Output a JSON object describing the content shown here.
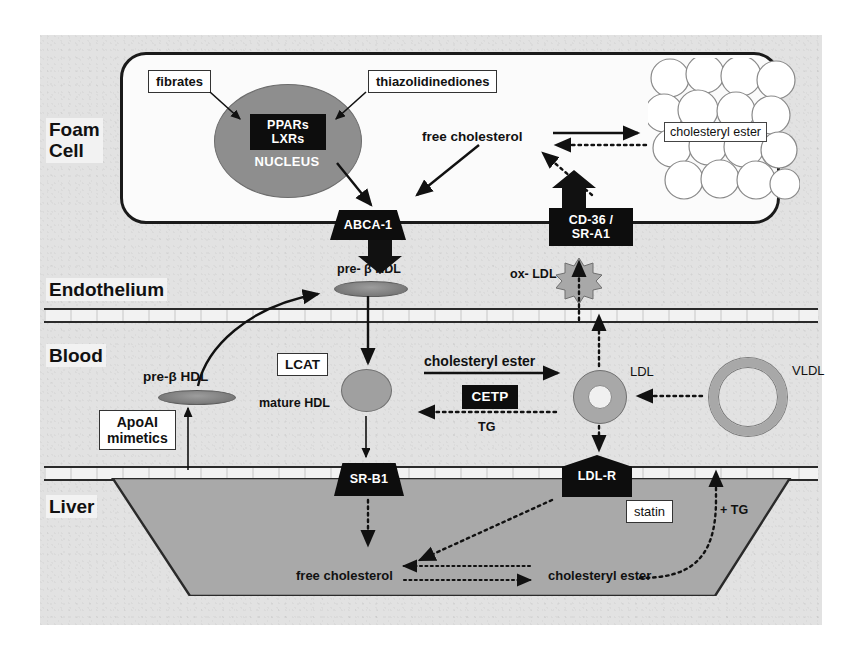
{
  "figure": {
    "background_color": "#e2e2e2",
    "accent_black": "#0d0d0d",
    "gray_fill": "#a9a9a9"
  },
  "sections": [
    {
      "id": "foam-cell",
      "label": "Foam\nCell"
    },
    {
      "id": "endothelium",
      "label": "Endothelium"
    },
    {
      "id": "blood",
      "label": "Blood"
    },
    {
      "id": "liver",
      "label": "Liver"
    }
  ],
  "foam_cell": {
    "nucleus": {
      "genes": [
        "PPARs",
        "LXRs"
      ],
      "name": "NUCLEUS"
    },
    "drugs": [
      {
        "id": "fibrates",
        "label": "fibrates"
      },
      {
        "id": "thiazolidinediones",
        "label": "thiazolidinediones"
      }
    ],
    "free_cholesterol": "free cholesterol",
    "cholesteryl_ester": "cholesteryl ester",
    "receptors": [
      {
        "id": "abca1",
        "lines": [
          "ABCA-1"
        ]
      },
      {
        "id": "cd36-sra1",
        "lines": [
          "CD-36 /",
          "SR-A1"
        ]
      }
    ],
    "particles": [
      {
        "id": "pre-beta-hdl-apical",
        "label": "pre- β HDL"
      },
      {
        "id": "ox-ldl",
        "label": "ox- LDL"
      }
    ]
  },
  "blood": {
    "particles": [
      {
        "id": "pre-beta-hdl",
        "label": "pre-β HDL"
      },
      {
        "id": "mature-hdl",
        "label": "mature HDL"
      },
      {
        "id": "ldl",
        "label": "LDL"
      },
      {
        "id": "vldl",
        "label": "VLDL"
      }
    ],
    "enzymes": [
      {
        "id": "lcat",
        "label": "LCAT"
      },
      {
        "id": "cetp",
        "label": "CETP"
      }
    ],
    "drugs": [
      {
        "id": "apoai-mimetics",
        "label": "ApoAI\nmimetics"
      }
    ],
    "flux_labels": [
      {
        "id": "cholesteryl-ester-flux",
        "label": "cholesteryl ester"
      },
      {
        "id": "tg-flux",
        "label": "TG"
      }
    ]
  },
  "liver": {
    "receptors": [
      {
        "id": "sr-b1",
        "lines": [
          "SR-B1"
        ]
      },
      {
        "id": "ldl-r",
        "lines": [
          "LDL-R"
        ]
      }
    ],
    "drugs": [
      {
        "id": "statin",
        "label": "statin"
      }
    ],
    "pools": [
      {
        "id": "liver-free-cholesterol",
        "label": "free cholesterol"
      },
      {
        "id": "liver-cholesteryl-ester",
        "label": "cholesteryl ester"
      }
    ],
    "flux_labels": [
      {
        "id": "plus-tg",
        "label": "+ TG"
      }
    ]
  }
}
